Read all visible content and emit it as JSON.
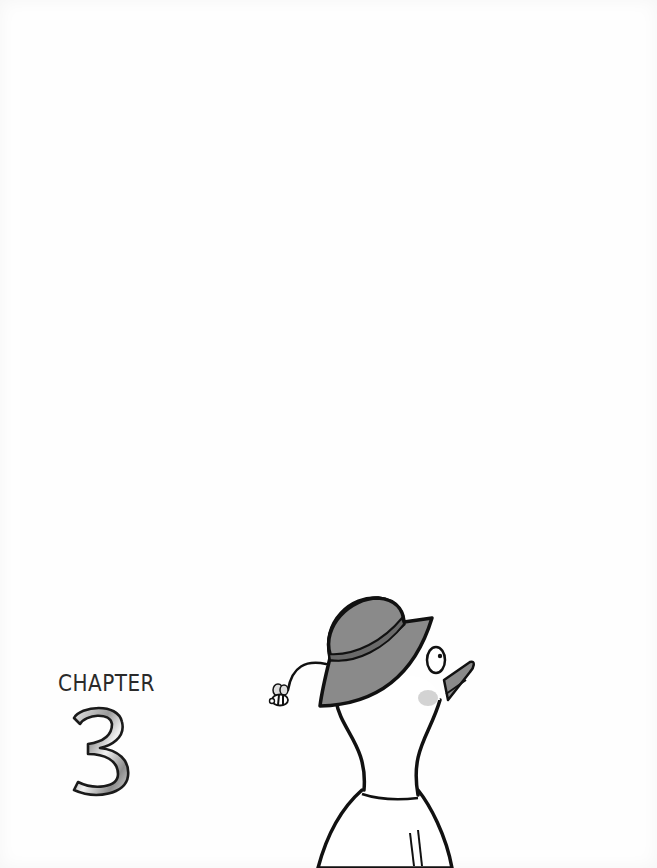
{
  "page": {
    "type": "chapter-opener",
    "background_color": "#ffffff"
  },
  "chapter": {
    "label": "CHAPTER",
    "number": "3"
  },
  "illustration": {
    "description": "Character in a gray bucket hat seen from behind, looking up at a tiny bee on a curly trail",
    "elements": [
      "bucket-hat",
      "bee",
      "head",
      "eye",
      "beak",
      "neck",
      "collar",
      "body"
    ],
    "colors": {
      "outline": "#111111",
      "hat": "#8a8a8a",
      "hat_band": "#6a6a6a",
      "cheek": "#c8c8c8",
      "body": "#ffffff"
    }
  }
}
